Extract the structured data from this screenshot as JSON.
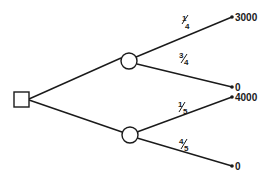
{
  "diagram": {
    "type": "decision-tree",
    "decision_node": {
      "shape": "square",
      "x": 14,
      "y": 92,
      "size": 15
    },
    "chance_nodes": [
      {
        "id": "upper",
        "cx": 129,
        "cy": 61,
        "r": 8,
        "branches": [
          {
            "probability": {
              "num": "1",
              "den": "4"
            },
            "payoff": "3000",
            "end": {
              "x": 232,
              "y": 17
            },
            "label_pos": {
              "x": 183,
              "y": 21
            }
          },
          {
            "probability": {
              "num": "3",
              "den": "4"
            },
            "payoff": "0",
            "end": {
              "x": 232,
              "y": 87
            },
            "label_pos": {
              "x": 182,
              "y": 59
            }
          }
        ]
      },
      {
        "id": "lower",
        "cx": 130,
        "cy": 135,
        "r": 8,
        "branches": [
          {
            "probability": {
              "num": "1",
              "den": "5"
            },
            "payoff": "4000",
            "end": {
              "x": 232,
              "y": 97
            },
            "label_pos": {
              "x": 180,
              "y": 104
            }
          },
          {
            "probability": {
              "num": "4",
              "den": "5"
            },
            "payoff": "0",
            "end": {
              "x": 232,
              "y": 166
            },
            "label_pos": {
              "x": 182,
              "y": 140
            }
          }
        ]
      }
    ]
  },
  "labels": {
    "p_up_1_num": "1",
    "p_up_1_den": "4",
    "p_up_2_num": "3",
    "p_up_2_den": "4",
    "p_lo_1_num": "1",
    "p_lo_1_den": "5",
    "p_lo_2_num": "4",
    "p_lo_2_den": "5",
    "payoff_up_1": "3000",
    "payoff_up_2": "0",
    "payoff_lo_1": "4000",
    "payoff_lo_2": "0"
  },
  "colors": {
    "line": "#1a1a1a",
    "background": "#ffffff"
  }
}
